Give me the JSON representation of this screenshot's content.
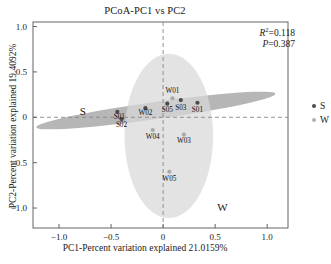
{
  "title": "PCoA-PC1 vs PC2",
  "stats": {
    "r2_symbol": "R",
    "r2_exp": "2",
    "r2_value": "=0.118",
    "p_symbol": "P",
    "p_value": "=0.387"
  },
  "axes": {
    "xlabel": "PC1-Percent variation explained 21.0159%",
    "ylabel": "PC2-Percent variation explained 19.4092%",
    "xticks": [
      "-1.0",
      "-0.5",
      "0",
      "0.5",
      "1.0"
    ],
    "yticks": [
      "1.0",
      "0.5",
      "0",
      "-0.5",
      "-1.0"
    ]
  },
  "group_labels": {
    "s": "S",
    "w": "W"
  },
  "legend": {
    "items": [
      {
        "label": "S",
        "color": "#4d4d4d"
      },
      {
        "label": "W",
        "color": "#b0b0b0"
      }
    ]
  },
  "colors": {
    "s_point": "#4a4a4a",
    "w_point": "#a8a8a8",
    "s_ellipse": "#9a9a9a",
    "w_ellipse": "#d8d8d8",
    "axis": "#555555",
    "guide": "#888888"
  },
  "chart_data": {
    "type": "scatter",
    "title": "PCoA-PC1 vs PC2",
    "xlabel": "PC1-Percent variation explained 21.0159%",
    "ylabel": "PC2-Percent variation explained 19.4092%",
    "xlim": [
      -1.25,
      1.2
    ],
    "ylim": [
      -1.22,
      1.05
    ],
    "xticks": [
      -1.0,
      -0.5,
      0,
      0.5,
      1.0
    ],
    "yticks": [
      1.0,
      0.5,
      0,
      -0.5,
      -1.0
    ],
    "grid": false,
    "legend_position": "right",
    "annotations": [
      {
        "text": "R2=0.118",
        "x": 0.72,
        "y": 0.92
      },
      {
        "text": "P=0.387",
        "x": 0.72,
        "y": 0.84
      },
      {
        "text": "S",
        "x": -0.8,
        "y": 0.06
      },
      {
        "text": "W",
        "x": 0.52,
        "y": -1.0
      }
    ],
    "series": [
      {
        "name": "S",
        "color": "#4a4a4a",
        "points": [
          {
            "label": "S01",
            "x": -0.44,
            "y": 0.06,
            "label_dx": 0.02,
            "label_dy": -0.055
          },
          {
            "label": "S02",
            "x": -0.4,
            "y": -0.02,
            "label_dx": 0.0,
            "label_dy": -0.07
          },
          {
            "label": "W02",
            "x": -0.17,
            "y": 0.1,
            "label_dx": 0.0,
            "label_dy": -0.055
          },
          {
            "label": "S05",
            "x": 0.04,
            "y": 0.15,
            "label_dx": 0.0,
            "label_dy": -0.075
          },
          {
            "label": "S03",
            "x": 0.17,
            "y": 0.19,
            "label_dx": 0.0,
            "label_dy": -0.085
          },
          {
            "label": "S01",
            "x": 0.33,
            "y": 0.16,
            "label_dx": 0.0,
            "label_dy": -0.08
          }
        ]
      },
      {
        "name": "W",
        "color": "#a8a8a8",
        "points": [
          {
            "label": "W01",
            "x": 0.09,
            "y": 0.21,
            "label_dx": 0.0,
            "label_dy": 0.085
          },
          {
            "label": "W04",
            "x": -0.1,
            "y": -0.14,
            "label_dx": 0.0,
            "label_dy": -0.075
          },
          {
            "label": "W03",
            "x": 0.2,
            "y": -0.19,
            "label_dx": 0.0,
            "label_dy": -0.075
          },
          {
            "label": "W05",
            "x": 0.06,
            "y": -0.6,
            "label_dx": 0.0,
            "label_dy": -0.075
          }
        ]
      }
    ],
    "ellipses": [
      {
        "group": "S",
        "cx": -0.07,
        "cy": 0.075,
        "rx": 1.16,
        "ry": 0.095,
        "angle": -8.0,
        "fill": "#9a9a9a"
      },
      {
        "group": "W",
        "cx": 0.055,
        "cy": -0.205,
        "rx": 0.425,
        "ry": 0.905,
        "angle": 0,
        "fill": "#d8d8d8"
      }
    ]
  }
}
